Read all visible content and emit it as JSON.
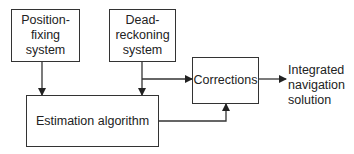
{
  "diagram": {
    "blocks": {
      "position_fixing": "Position-\nfixing\nsystem",
      "dead_reckoning": "Dead-\nreckoning\nsystem",
      "corrections": "Corrections",
      "estimation": "Estimation algorithm"
    },
    "output_label": "Integrated\nnavigation\nsolution",
    "connections": [
      {
        "from": "position_fixing",
        "to": "estimation"
      },
      {
        "from": "dead_reckoning",
        "to": "estimation"
      },
      {
        "from": "dead_reckoning",
        "to": "corrections"
      },
      {
        "from": "estimation",
        "to": "corrections"
      },
      {
        "from": "corrections",
        "to": "output_label"
      }
    ],
    "line_color": "#333333"
  }
}
